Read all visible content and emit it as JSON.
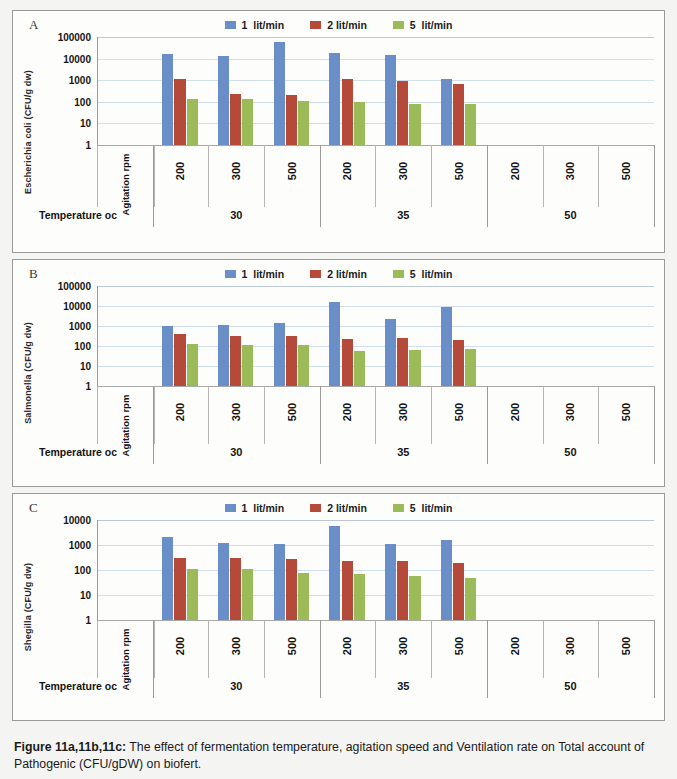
{
  "figure": {
    "caption_bold": "Figure 11a,11b,11c:",
    "caption_rest": " The effect of fermentation temperature, agitation speed and Ventilation rate on Total account of Pathogenic (CFU/gDW) on biofert."
  },
  "colors": {
    "series1": "#6a8fc8",
    "series2": "#b5493a",
    "series3": "#9bbb59",
    "grid": "#cfe0ec",
    "axis": "#9a9a9a",
    "panel_bg": "#fdfdfb",
    "page_bg": "#f4f4f2"
  },
  "labels": {
    "agitation_axis": "Agitation rpm",
    "temperature_axis": "Temperature oc",
    "panel_a": "A",
    "panel_b": "B",
    "panel_c": "C"
  },
  "legend": {
    "items": [
      {
        "label": "1  lit/min",
        "color": "#6a8fc8"
      },
      {
        "label": "2 lit/min",
        "color": "#b5493a"
      },
      {
        "label": "5  lit/min",
        "color": "#9bbb59"
      }
    ]
  },
  "chart_data": [
    {
      "panel": "A",
      "type": "bar",
      "title": "Escherichia coli (CFU/g dw)",
      "ylabel": "Escherichia coli (CFU/g dw)",
      "xlabel": "Agitation rpm",
      "group_label": "Temperature oc",
      "yscale": "log",
      "ylim": [
        1,
        100000
      ],
      "yticks": [
        1,
        10,
        100,
        1000,
        10000,
        100000
      ],
      "ytick_labels": [
        "1",
        "10",
        "100",
        "1000",
        "10000",
        "100000"
      ],
      "grid": true,
      "legend_position": "top-center",
      "groups": [
        "30",
        "35",
        "50"
      ],
      "categories": [
        "200",
        "300",
        "500",
        "200",
        "300",
        "500",
        "200",
        "300",
        "500"
      ],
      "series": [
        {
          "name": "1 lit/min",
          "color": "#6a8fc8",
          "values": [
            17000,
            13000,
            60000,
            19000,
            14000,
            1200,
            null,
            null,
            null
          ]
        },
        {
          "name": "2 lit/min",
          "color": "#b5493a",
          "values": [
            1200,
            220,
            200,
            1150,
            900,
            700,
            null,
            null,
            null
          ]
        },
        {
          "name": "5 lit/min",
          "color": "#9bbb59",
          "values": [
            140,
            130,
            110,
            95,
            80,
            80,
            null,
            null,
            null
          ]
        }
      ]
    },
    {
      "panel": "B",
      "type": "bar",
      "title": "Salmonella (CFU/g dw)",
      "ylabel": "Salmonella (CFU/g dw)",
      "xlabel": "Agitation rpm",
      "group_label": "Temperature oc",
      "yscale": "log",
      "ylim": [
        1,
        100000
      ],
      "yticks": [
        1,
        10,
        100,
        1000,
        10000,
        100000
      ],
      "ytick_labels": [
        "1",
        "10",
        "100",
        "1000",
        "10000",
        "100000"
      ],
      "grid": true,
      "legend_position": "top-center",
      "groups": [
        "30",
        "35",
        "50"
      ],
      "categories": [
        "200",
        "300",
        "500",
        "200",
        "300",
        "500",
        "200",
        "300",
        "500"
      ],
      "series": [
        {
          "name": "1 lit/min",
          "color": "#6a8fc8",
          "values": [
            1000,
            1100,
            1400,
            15000,
            2300,
            9000,
            null,
            null,
            null
          ]
        },
        {
          "name": "2 lit/min",
          "color": "#b5493a",
          "values": [
            400,
            330,
            300,
            230,
            250,
            210,
            null,
            null,
            null
          ]
        },
        {
          "name": "5 lit/min",
          "color": "#9bbb59",
          "values": [
            130,
            115,
            115,
            55,
            62,
            70,
            null,
            null,
            null
          ]
        }
      ]
    },
    {
      "panel": "C",
      "type": "bar",
      "title": "Shegilla (CFU/g dw)",
      "ylabel": "Shegilla (CFU/g dw)",
      "xlabel": "Agitation rpm",
      "group_label": "Temperature oc",
      "yscale": "log",
      "ylim": [
        1,
        10000
      ],
      "yticks": [
        1,
        10,
        100,
        1000,
        10000
      ],
      "ytick_labels": [
        "1",
        "10",
        "100",
        "1000",
        "10000"
      ],
      "grid": true,
      "legend_position": "top-center",
      "groups": [
        "30",
        "35",
        "50"
      ],
      "categories": [
        "200",
        "300",
        "500",
        "200",
        "300",
        "500",
        "200",
        "300",
        "500"
      ],
      "series": [
        {
          "name": "1 lit/min",
          "color": "#6a8fc8",
          "values": [
            2000,
            1200,
            1050,
            6000,
            1050,
            1600,
            null,
            null,
            null
          ]
        },
        {
          "name": "2 lit/min",
          "color": "#b5493a",
          "values": [
            300,
            310,
            280,
            240,
            230,
            185,
            null,
            null,
            null
          ]
        },
        {
          "name": "5 lit/min",
          "color": "#9bbb59",
          "values": [
            105,
            105,
            78,
            70,
            60,
            48,
            null,
            null,
            null
          ]
        }
      ]
    }
  ]
}
